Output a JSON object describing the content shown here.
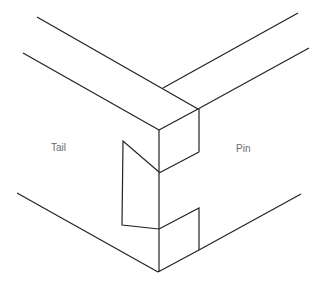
{
  "diagram": {
    "type": "dovetail-joint-isometric",
    "labels": {
      "tail": "Tail",
      "pin": "Pin"
    },
    "colors": {
      "line": "#222222",
      "label": "#6a6a6a",
      "background": "#ffffff"
    }
  }
}
